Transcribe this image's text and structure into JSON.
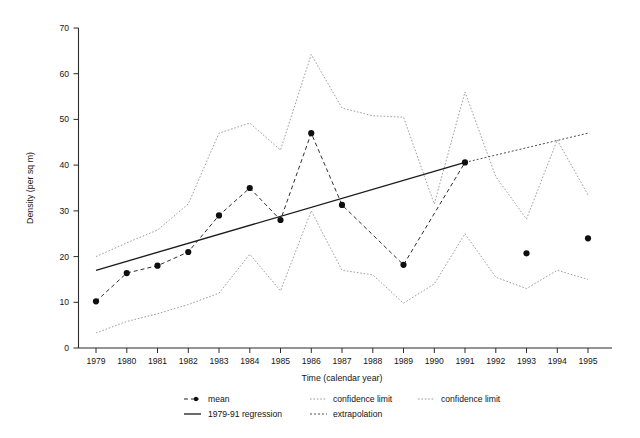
{
  "chart_data": {
    "type": "line",
    "title": "",
    "xlabel": "Time (calendar year)",
    "ylabel": "Density (per sq m)",
    "xlim": [
      1978.4,
      1995.7
    ],
    "ylim": [
      0,
      70
    ],
    "yticks": [
      0,
      10,
      20,
      30,
      40,
      50,
      60,
      70
    ],
    "xticks": [
      1979,
      1980,
      1981,
      1982,
      1983,
      1984,
      1985,
      1986,
      1987,
      1988,
      1989,
      1990,
      1991,
      1992,
      1993,
      1994,
      1995
    ],
    "grid": false,
    "legend_position": "below-axes",
    "x": [
      1979,
      1980,
      1981,
      1982,
      1983,
      1984,
      1985,
      1986,
      1987,
      1989,
      1991,
      1993,
      1995
    ],
    "series": [
      {
        "name": "mean",
        "style": "dashed-with-markers",
        "x": [
          1979,
          1980,
          1981,
          1982,
          1983,
          1984,
          1985,
          1986,
          1987,
          1989,
          1991,
          1993,
          1995
        ],
        "values": [
          10.2,
          16.4,
          18.0,
          21.0,
          29.0,
          35.0,
          28.0,
          47.0,
          31.3,
          18.2,
          40.6,
          20.7,
          24.0
        ],
        "connected_through": [
          1979,
          1980,
          1981,
          1982,
          1983,
          1984,
          1985,
          1986,
          1987,
          1989,
          1991
        ]
      },
      {
        "name": "1979-91 regression",
        "style": "solid",
        "x": [
          1979,
          1991
        ],
        "values": [
          17.0,
          40.6
        ]
      },
      {
        "name": "extrapolation",
        "style": "dotted",
        "x": [
          1991,
          1995
        ],
        "values": [
          40.6,
          47.0
        ]
      },
      {
        "name": "confidence limit",
        "style": "dotted-upper",
        "x": [
          1979,
          1980,
          1981,
          1982,
          1983,
          1984,
          1985,
          1986,
          1987,
          1988,
          1989,
          1990,
          1991,
          1992,
          1993,
          1994,
          1995
        ],
        "values": [
          20.0,
          23.0,
          25.8,
          31.5,
          47.0,
          49.2,
          43.3,
          64.2,
          52.5,
          50.8,
          50.5,
          31.5,
          56.0,
          37.5,
          28.2,
          45.5,
          33.5
        ]
      },
      {
        "name": "confidence limit",
        "style": "dotted-lower",
        "x": [
          1979,
          1980,
          1981,
          1982,
          1983,
          1984,
          1985,
          1986,
          1987,
          1988,
          1989,
          1990,
          1991,
          1992,
          1993,
          1994,
          1995
        ],
        "values": [
          3.3,
          5.8,
          7.5,
          9.5,
          12.0,
          20.5,
          12.5,
          30.0,
          17.0,
          16.0,
          9.8,
          14.0,
          25.0,
          15.5,
          13.0,
          17.0,
          15.0
        ]
      }
    ]
  },
  "axes": {
    "y_title": "Density (per sq m)",
    "x_title": "Time (calendar year)",
    "y_ticks": [
      "0",
      "10",
      "20",
      "30",
      "40",
      "50",
      "60",
      "70"
    ],
    "x_ticks": [
      "1979",
      "1980",
      "1981",
      "1982",
      "1983",
      "1984",
      "1985",
      "1986",
      "1987",
      "1988",
      "1989",
      "1990",
      "1991",
      "1992",
      "1993",
      "1994",
      "1995"
    ]
  },
  "legend": {
    "entries": [
      {
        "label": "mean",
        "marker": "dash-dot-marker",
        "row": 1,
        "col": 1
      },
      {
        "label": "confidence limit",
        "marker": "dotted-line",
        "row": 1,
        "col": 2
      },
      {
        "label": "confidence limit",
        "marker": "dotted-line",
        "row": 1,
        "col": 3
      },
      {
        "label": "1979-91 regression",
        "marker": "solid-line",
        "row": 2,
        "col": 1
      },
      {
        "label": "extrapolation",
        "marker": "dotted-line",
        "row": 2,
        "col": 2
      }
    ]
  },
  "colors": {
    "axis": "#2b2b2b",
    "mean": "#232323",
    "regression": "#1b1b1b",
    "extrapolation": "#3a3a3a",
    "confidence": "#8d8d8d",
    "background": "#ffffff"
  }
}
